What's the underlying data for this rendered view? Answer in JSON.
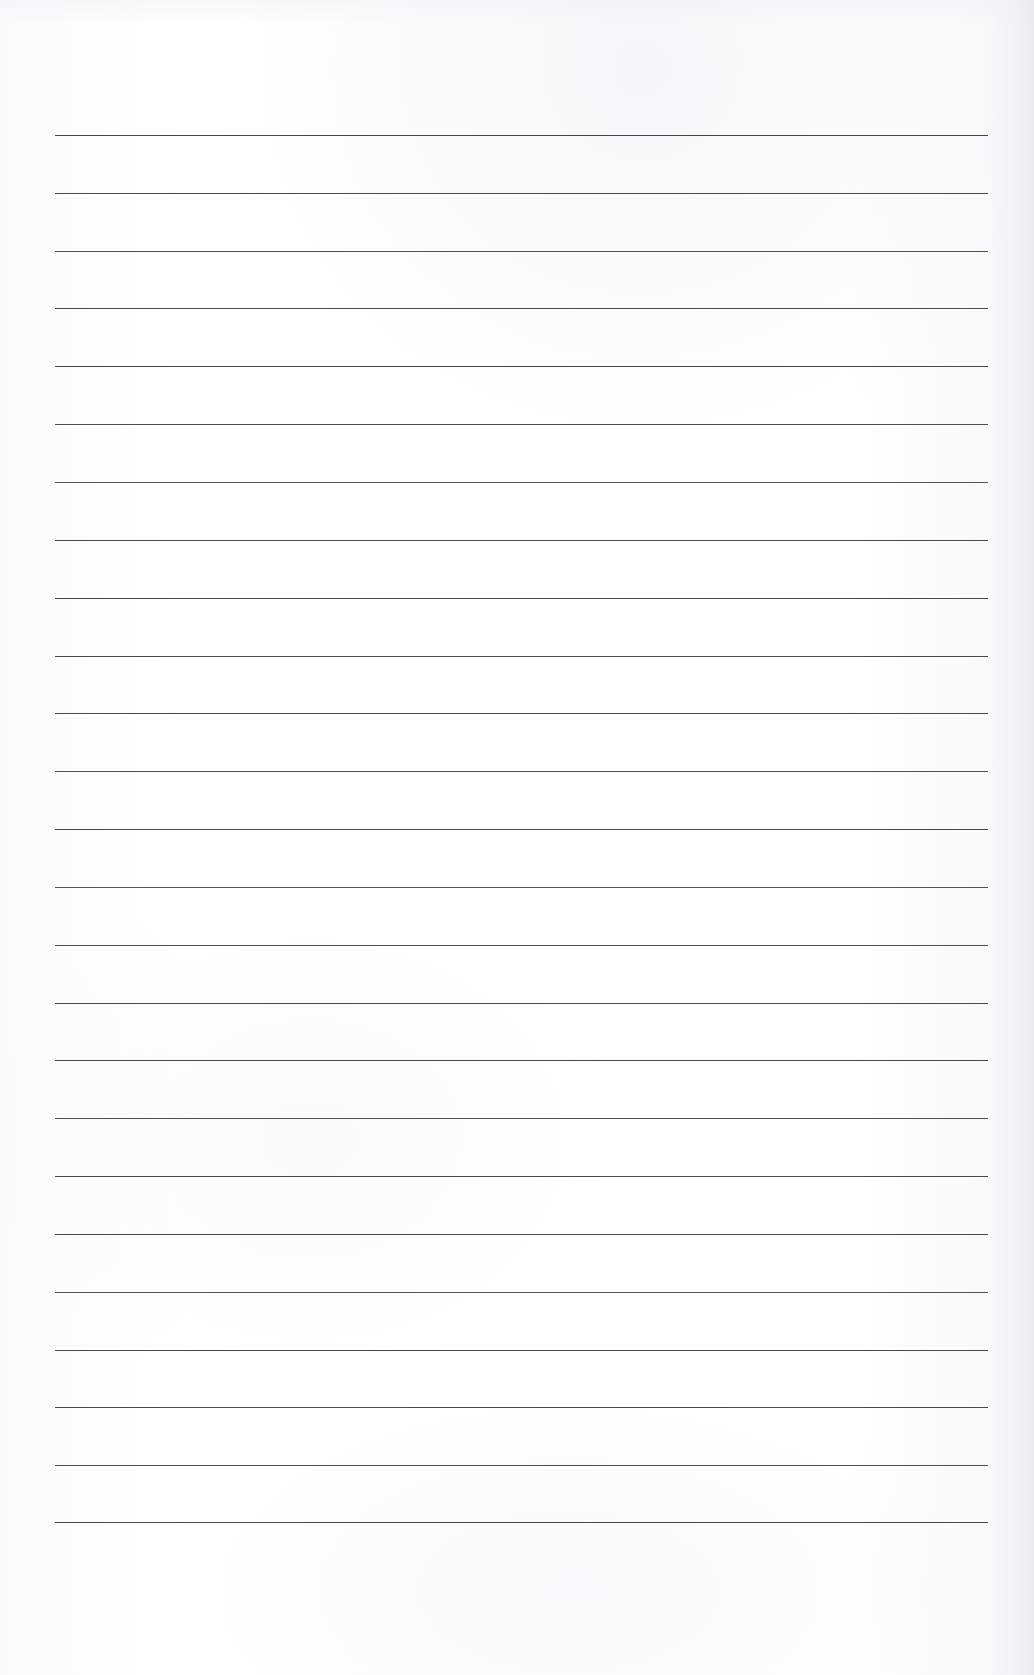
{
  "document": {
    "kind": "lined-paper",
    "title": "Blank Ruled Notebook Page",
    "orientation": "portrait",
    "page_width": 1034,
    "page_height": 1675,
    "background_color": "#fdfdfe",
    "has_text_content": false,
    "has_header": false,
    "has_page_number": false,
    "has_margin_rule": false,
    "written_content": ""
  },
  "ruling": {
    "line_count": 25,
    "line_color": "#3c3c41",
    "line_thickness_px": 1.7,
    "first_line_y": 135,
    "last_line_y": 1522,
    "line_spacing_px": 57.8,
    "line_left_x": 55,
    "line_right_x": 988,
    "line_length_px": 933,
    "lines_y": [
      135,
      193,
      251,
      308,
      366,
      424,
      482,
      540,
      598,
      656,
      713,
      771,
      829,
      887,
      945,
      1003,
      1060,
      1118,
      1176,
      1234,
      1292,
      1350,
      1407,
      1465,
      1522
    ]
  },
  "margins": {
    "top_px": 135,
    "bottom_px": 153,
    "left_px": 55,
    "right_px": 46
  }
}
